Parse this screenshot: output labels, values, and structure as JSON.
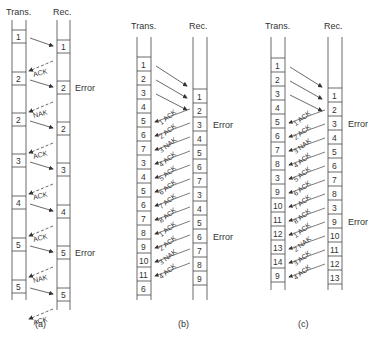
{
  "panels": [
    {
      "id": "a",
      "caption": "(a)",
      "trans_header": "Trans.",
      "rec_header": "Rec.",
      "trans_frames": [
        "1",
        "2",
        "2",
        "3",
        "4",
        "5",
        "5"
      ],
      "rec_frames": [
        "1",
        "2",
        "2",
        "3",
        "4",
        "5",
        "5"
      ],
      "rec_error_index": [
        1,
        5
      ],
      "responses": [
        "ACK",
        "NAK",
        "ACK",
        "ACK",
        "ACK",
        "NAK",
        "ACK"
      ],
      "error_label": "Error"
    },
    {
      "id": "b",
      "caption": "(b)",
      "trans_header": "Trans.",
      "rec_header": "Rec.",
      "trans_frames": [
        "1",
        "2",
        "3",
        "4",
        "5",
        "6",
        "7",
        "3",
        "4",
        "5",
        "6",
        "7",
        "8",
        "9",
        "10",
        "11",
        "6"
      ],
      "rec_frames": [
        "1",
        "2",
        "3",
        "4",
        "5",
        "6",
        "7",
        "3",
        "4",
        "5",
        "6",
        "7",
        "8",
        "9"
      ],
      "rec_error_index": [
        2,
        10
      ],
      "responses": [
        "1 ACK",
        "2 ACK",
        "3 NAK",
        "4 ACK",
        "5 ACK",
        "6 ACK",
        "7 ACK",
        "8 ACK",
        "1 ACK",
        "2 ACK",
        "3 NAK",
        "4 ACK"
      ],
      "error_label": "Error"
    },
    {
      "id": "c",
      "caption": "(c)",
      "trans_header": "Trans.",
      "rec_header": "Rec.",
      "trans_frames": [
        "1",
        "2",
        "3",
        "4",
        "5",
        "6",
        "7",
        "8",
        "3",
        "9",
        "10",
        "11",
        "12",
        "13",
        "14",
        "9"
      ],
      "rec_frames": [
        "1",
        "2",
        "3",
        "4",
        "5",
        "6",
        "7",
        "8",
        "3",
        "9",
        "10",
        "11",
        "12",
        "13"
      ],
      "rec_error_index": [
        2,
        9
      ],
      "responses": [
        "1 ACK",
        "2 ACK",
        "3 NAK",
        "4 ACK",
        "5 ACK",
        "6 ACK",
        "7 ACK",
        "8 ACK",
        "1 ACK",
        "2 NAK",
        "3 ACK",
        "4 ACK"
      ],
      "error_label": "Error"
    }
  ]
}
